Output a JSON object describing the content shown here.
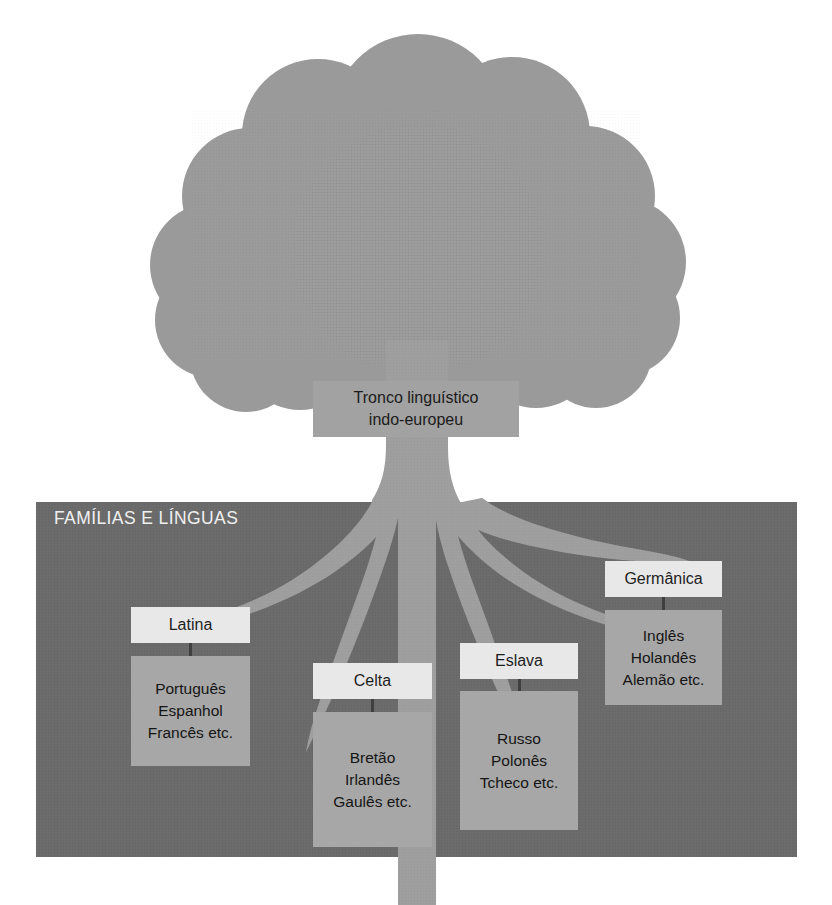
{
  "figure": {
    "title_alt": "Tronco linguístico indo-europeu",
    "background_color": "#ffffff",
    "canopy_color": "#9a9a9a",
    "trunk_color": "#9e9e9e",
    "ground_color": "#6a6a6a",
    "header_box_color": "#e8e8e8",
    "body_box_color": "#a7a7a7",
    "text_color": "#1b1b1b",
    "ground_label_color": "#f0f0f0"
  },
  "trunk": {
    "line1": "Tronco linguístico",
    "line2": "indo-europeu"
  },
  "ground": {
    "label": "FAMÍLIAS E LÍNGUAS"
  },
  "families": [
    {
      "name": "Latina",
      "languages": [
        "Português",
        "Espanhol",
        "Francês etc."
      ]
    },
    {
      "name": "Celta",
      "languages": [
        "Bretão",
        "Irlandês",
        "Gaulês etc."
      ]
    },
    {
      "name": "Eslava",
      "languages": [
        "Russo",
        "Polonês",
        "Tcheco etc."
      ]
    },
    {
      "name": "Germânica",
      "languages": [
        "Inglês",
        "Holandês",
        "Alemão etc."
      ]
    }
  ]
}
